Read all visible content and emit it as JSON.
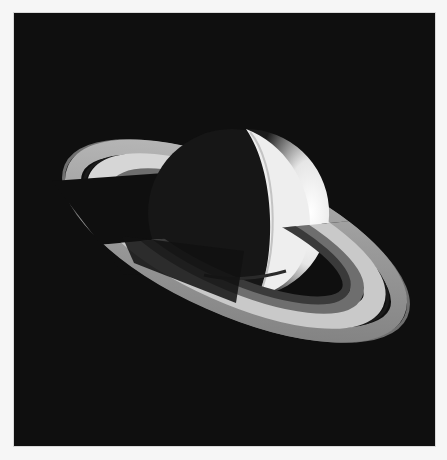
{
  "image": {
    "subject": "Saturn with its ring system",
    "alt": "Black-and-white photograph of Saturn seen at an oblique angle, rings tilted, planet partly in shadow, on a black background",
    "colors": {
      "page_background": "#f6f6f6",
      "space": "#0f0f0f",
      "planet_lit": "#f2f2f2",
      "planet_shadow": "#151515",
      "ring_outer": "#8a8a8a",
      "ring_bright": "#cfcfcf",
      "ring_mid": "#6e6e6e",
      "cassini_division": "#1a1a1a"
    }
  }
}
